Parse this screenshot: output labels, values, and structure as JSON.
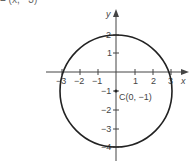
{
  "caption_fragment": "= (x, −3)",
  "diagram": {
    "x_axis_label": "x",
    "y_axis_label": "y",
    "x_ticks": [
      {
        "value": -3,
        "label": "−3"
      },
      {
        "value": -2,
        "label": "−2"
      },
      {
        "value": -1,
        "label": "−1"
      },
      {
        "value": 1,
        "label": "1"
      },
      {
        "value": 2,
        "label": "2"
      },
      {
        "value": 3,
        "label": "3"
      }
    ],
    "y_ticks": [
      {
        "value": 2,
        "label": "2"
      },
      {
        "value": 1,
        "label": "1"
      },
      {
        "value": -1,
        "label": "−1"
      },
      {
        "value": -2,
        "label": "−2"
      },
      {
        "value": -3,
        "label": "−3"
      },
      {
        "value": -4,
        "label": "−4"
      }
    ],
    "circle": {
      "center_x": 0,
      "center_y": -1,
      "radius": 3
    },
    "center_label": "C(0, −1)",
    "line_color": "#222222"
  }
}
